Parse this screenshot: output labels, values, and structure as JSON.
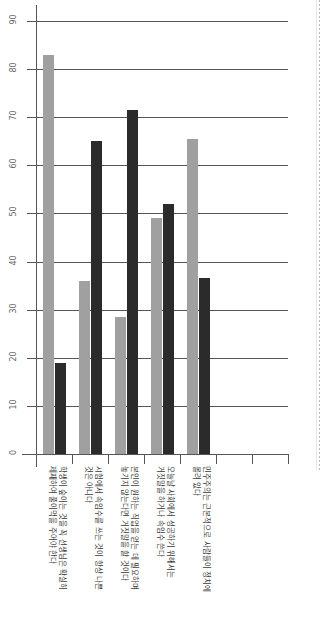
{
  "chart_data": {
    "type": "bar",
    "title": "",
    "xlabel": "",
    "ylabel": "",
    "orientation": "rotated-90",
    "grid": true,
    "legend_position": "none",
    "ylim": [
      0,
      90
    ],
    "yticks": [
      0,
      10,
      20,
      30,
      40,
      50,
      60,
      70,
      80,
      90
    ],
    "ytick_labels": [
      "0",
      "10",
      "20",
      "30",
      "40",
      "50",
      "60",
      "70",
      "80",
      "90"
    ],
    "categories": [
      "학생이 숲이는 것을 꼭 선생님은 확실히 제재하여 풀이먹을 주어야 한다",
      "시험에서 속임수를 쓰는 것이 항상 나쁜 것은 아니다",
      "본인이 원하는 직업을 얻는 데 필요하다면 거짓말을 할 것이다",
      "오늘날 사회에서 성공하기 위해서는 거짓말을 하거나 속임수 쓴다",
      "민주주의는 근본적으로 사람들이 정치에 몰려 있다"
    ],
    "category_lines": [
      [
        "학생이 숲이는 것을 꼭 선생님은 확실히",
        "제재하여 풀이먹을 주어야 한다"
      ],
      [
        "시험에서 속임수를 쓰는 것이 항상 나쁜",
        "것은 아니다"
      ],
      [
        "본인이 원하는 직업을 얻는 데 필요하며",
        "놓기지 않는다면 거짓말을 할 것이다"
      ],
      [
        "오늘날 사회에서 성공하기 위해서는",
        "거짓말을 하거나 속임수 쓴다"
      ],
      [
        "민주주의는 근본적으로 사람들이 정치에",
        "몰려 있다"
      ]
    ],
    "series": [
      {
        "name": "series-gray",
        "color": "#a0a0a0",
        "values": [
          83,
          36,
          28.5,
          49,
          65.5
        ]
      },
      {
        "name": "series-black",
        "color": "#2b2b2b",
        "values": [
          19,
          65,
          71.5,
          52,
          36.5
        ]
      }
    ],
    "empty_slots": 2
  },
  "colors": {
    "gray_series": "#a0a0a0",
    "black_series": "#2b2b2b",
    "axis": "#555555",
    "grid": "#555555",
    "tick_label": "#666666",
    "category_label": "#3a3a3a",
    "background": "#ffffff"
  }
}
